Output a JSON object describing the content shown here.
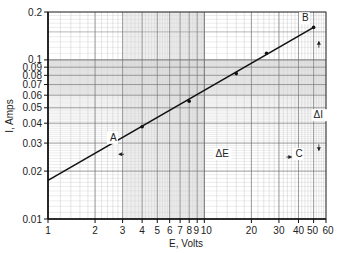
{
  "chart_data": {
    "type": "line",
    "title": "",
    "xlabel": "E, Volts",
    "ylabel": "I, Amps",
    "xscale": "log",
    "yscale": "log",
    "xlim": [
      1,
      60
    ],
    "ylim": [
      0.01,
      0.2
    ],
    "grid": true,
    "x_tick_labels": [
      "1",
      "2",
      "3",
      "4",
      "5",
      "6",
      "7",
      "8",
      "9",
      "10",
      "20",
      "30",
      "40",
      "50",
      "60"
    ],
    "x_ticks": [
      1,
      2,
      3,
      4,
      5,
      6,
      7,
      8,
      9,
      10,
      20,
      30,
      40,
      50,
      60
    ],
    "y_tick_labels": [
      "0.01",
      "0.02",
      "0.03",
      "0.04",
      "0.05",
      "0.06",
      "0.07",
      "0.08",
      "0.09",
      "0.1",
      "0.2"
    ],
    "y_ticks": [
      0.01,
      0.02,
      0.03,
      0.04,
      0.05,
      0.06,
      0.07,
      0.08,
      0.09,
      0.1,
      0.2
    ],
    "series": [
      {
        "name": "I vs E",
        "line": {
          "x": [
            1,
            50
          ],
          "y": [
            0.0175,
            0.16
          ]
        },
        "points": {
          "x": [
            4,
            8,
            16,
            25,
            50
          ],
          "y": [
            0.038,
            0.055,
            0.082,
            0.11,
            0.16
          ]
        }
      }
    ],
    "annotations": [
      {
        "text": "A",
        "x": 2.6,
        "y": 0.031
      },
      {
        "text": "B",
        "x": 44,
        "y": 0.175
      },
      {
        "text": "C",
        "x": 40,
        "y": 0.0245
      },
      {
        "text": "ΔE",
        "x": 12.5,
        "y": 0.0245
      },
      {
        "text": "ΔI",
        "x": 53,
        "y": 0.043
      }
    ],
    "shaded_bands": {
      "x": [
        3,
        10
      ],
      "y": [
        0.06,
        0.1
      ]
    }
  }
}
